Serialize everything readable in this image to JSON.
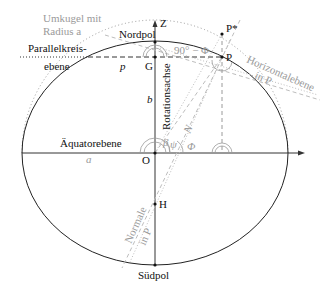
{
  "figure": {
    "labels": {
      "umkugel_line1": "Umkugel mit",
      "umkugel_line2": "Radius a",
      "umkugel_radius_symbol": "a",
      "nordpol": "Nordpol",
      "z_axis": "Z",
      "p_star": "P*",
      "p_point": "P",
      "g_point": "G",
      "parallel_line1": "Parallelkreis-",
      "parallel_line2": "ebene",
      "p_radius": "p",
      "angle_90_minus_phi": "90° − Φ",
      "horizontal_line1": "Horizontalebene",
      "horizontal_line2": "in P",
      "b_semiaxis": "b",
      "rotationsachse": "Rotationsachse",
      "aequatorebene": "Äquatorebene",
      "a_semiaxis": "a",
      "origin": "O",
      "h_point": "H",
      "normale_line1": "Normale",
      "normale_line2": "in P",
      "suedpol": "Südpol",
      "angle_phi": "Φ",
      "angle_psi": "ψ",
      "angle_beta": "β",
      "n_symbol": "N"
    },
    "colors": {
      "line": "#222222",
      "gray": "#9a9a9a",
      "light_gray": "#bdbdbd"
    }
  }
}
